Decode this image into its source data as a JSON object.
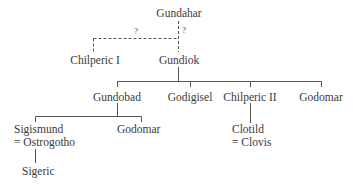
{
  "diagram": {
    "type": "family-tree",
    "nodes": {
      "gundahar": "Gundahar",
      "chilperic1": "Chilperic I",
      "gundiok": "Gundiok",
      "gundobad": "Gundobad",
      "godigisel": "Godigisel",
      "chilperic2": "Chilperic II",
      "godomar1": "Godomar",
      "sigismund": "Sigismund",
      "sigismund_spouse": "= Ostrogotho",
      "godomar2": "Godomar",
      "clotild": "Clotild",
      "clotild_spouse": "= Clovis",
      "sigeric": "Sigeric"
    },
    "uncertain_marks": {
      "left": "?",
      "right": "?"
    },
    "edges": [
      {
        "from": "Gundahar",
        "to": "Gundiok",
        "style": "dashed",
        "label": "?"
      },
      {
        "from": "Gundahar",
        "to": "Chilperic I",
        "style": "dashed",
        "label": "?"
      },
      {
        "from": "Gundiok",
        "to": "Gundobad",
        "style": "solid"
      },
      {
        "from": "Gundiok",
        "to": "Godigisel",
        "style": "solid"
      },
      {
        "from": "Gundiok",
        "to": "Chilperic II",
        "style": "solid"
      },
      {
        "from": "Gundiok",
        "to": "Godomar",
        "style": "solid"
      },
      {
        "from": "Gundobad",
        "to": "Sigismund",
        "style": "solid"
      },
      {
        "from": "Gundobad",
        "to": "Godomar",
        "style": "solid"
      },
      {
        "from": "Chilperic II",
        "to": "Clotild",
        "style": "solid"
      },
      {
        "from": "Sigismund",
        "to": "Sigeric",
        "style": "solid"
      }
    ],
    "colors": {
      "line": "#555555",
      "text": "#3a3a3a",
      "background": "#ffffff"
    }
  }
}
